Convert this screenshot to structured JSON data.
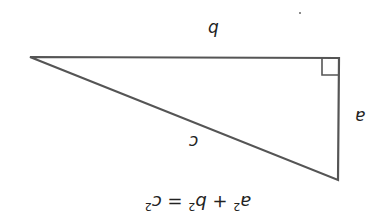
{
  "diagram": {
    "orientation": "upside-down",
    "stroke_color": "#555555",
    "vertices": {
      "acute_left": [
        30,
        57
      ],
      "right_angle": [
        339,
        58
      ],
      "acute_bottom": [
        338,
        180
      ]
    },
    "right_angle_marker": true,
    "labels": {
      "side_b": "b",
      "side_a": "a",
      "hypotenuse_c": "c"
    },
    "formula": {
      "a": "a",
      "b": "b",
      "c": "c",
      "exp": "2",
      "plus": "+",
      "equals": "="
    }
  }
}
